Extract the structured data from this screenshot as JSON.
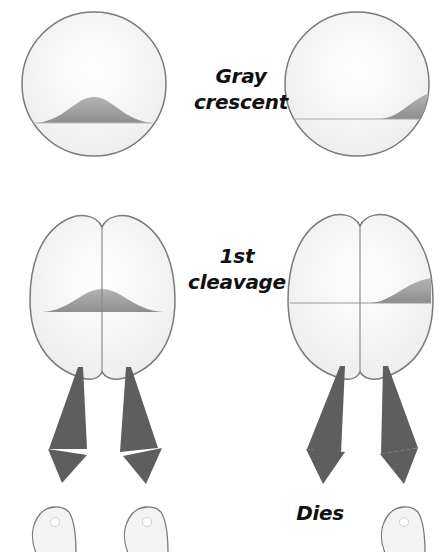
{
  "labels": {
    "gray_crescent": {
      "line1": "Gray",
      "line2": "crescent"
    },
    "first_cleavage": {
      "line1": "1st",
      "line2": "cleavage"
    },
    "dies": "Dies"
  },
  "colors": {
    "outline": "#7a7a7a",
    "cell_fill": "#f6f6f6",
    "crescent_fill": "#9a9a9a",
    "arrow_fill": "#5e5e5e",
    "text": "#111111"
  },
  "panels": {
    "left": {
      "zygote": "gray crescent centered (bisected by cleavage)",
      "outcomes": [
        "normal tadpole",
        "normal tadpole"
      ]
    },
    "right": {
      "zygote": "gray crescent on one side",
      "outcomes": [
        "dies",
        "normal tadpole"
      ]
    }
  }
}
